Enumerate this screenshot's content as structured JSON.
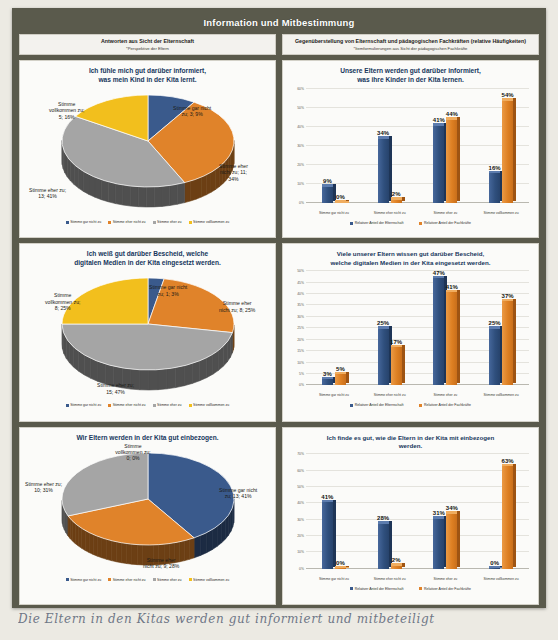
{
  "slide": {
    "title": "Information und Mitbestimmung",
    "frame_color": "#5a5a4c",
    "page_background": "#eceae3"
  },
  "columns": {
    "left": {
      "heading": "Antworten aus Sicht der Elternschaft",
      "subheading": "*Perspektive der Eltern"
    },
    "right": {
      "heading": "Gegenüberstellung von Elternschaft und pädagogischen Fachkräften (relative Häufigkeiten)",
      "subheading": "*Itemformulierungen aus Sicht der pädagogischen Fachkräfte"
    }
  },
  "palette": {
    "blue": "#3A5A8C",
    "orange": "#E0832A",
    "gray": "#A5A5A5",
    "yellow": "#F2BF1D",
    "title_text": "#16365C"
  },
  "pie_legend": [
    {
      "label": "Stimme gar nicht zu",
      "color": "#3A5A8C"
    },
    {
      "label": "Stimme eher nicht zu",
      "color": "#E0832A"
    },
    {
      "label": "Stimme eher zu",
      "color": "#A5A5A5"
    },
    {
      "label": "Stimme vollkommen zu",
      "color": "#F2BF1D"
    }
  ],
  "bar_legend": [
    {
      "label": "Relativer Anteil der Elternschaft",
      "color": "#3A5A8C"
    },
    {
      "label": "Relativer Anteil der Fachkräfte",
      "color": "#E0832A"
    }
  ],
  "bar_categories": [
    "Stimme gar nicht zu",
    "Stimme eher nicht zu",
    "Stimme eher zu",
    "Stimme vollkommen zu"
  ],
  "handwriting": "Die Eltern in den Kitas werden gut informiert und mitbeteiligt",
  "chart_data": [
    {
      "id": "pie1",
      "type": "pie",
      "title": "Ich fühle mich gut darüber informiert, was mein Kind in der Kita lernt.",
      "title_line1": "Ich fühle mich gut darüber informiert,",
      "title_line2": "was mein Kind in der Kita lernt.",
      "legend_position": "bottom",
      "categories": [
        "Stimme gar nicht zu",
        "Stimme eher nicht zu",
        "Stimme eher zu",
        "Stimme vollkommen zu"
      ],
      "counts": [
        3,
        11,
        13,
        5
      ],
      "percent": [
        9,
        34,
        41,
        16
      ],
      "colors": [
        "#3A5A8C",
        "#E0832A",
        "#A5A5A5",
        "#F2BF1D"
      ],
      "labels": [
        {
          "text_line1": "Stimme gar nicht",
          "text_line2": "zu; 3; 9%"
        },
        {
          "text_line1": "Stimme eher",
          "text_line2": "nicht zu; 11;",
          "text_line3": "34%"
        },
        {
          "text_line1": "Stimme eher zu;",
          "text_line2": "13; 41%"
        },
        {
          "text_line1": "Stimme",
          "text_line2": "vollkommen zu;",
          "text_line3": "5; 16%"
        }
      ]
    },
    {
      "id": "bar1",
      "type": "bar",
      "title_line1": "Unsere Eltern werden gut darüber informiert,",
      "title_line2": "was ihre Kinder in der Kita lernen.",
      "categories": [
        "Stimme gar nicht zu",
        "Stimme eher nicht zu",
        "Stimme eher zu",
        "Stimme vollkommen zu"
      ],
      "series": [
        {
          "name": "Relativer Anteil der Elternschaft",
          "color": "#3A5A8C",
          "values": [
            9,
            34,
            41,
            16
          ],
          "labels": [
            "9%",
            "34%",
            "41%",
            "16%"
          ]
        },
        {
          "name": "Relativer Anteil der Fachkräfte",
          "color": "#E0832A",
          "values": [
            0,
            2,
            44,
            54
          ],
          "labels": [
            "0%",
            "2%",
            "44%",
            "54%"
          ]
        }
      ],
      "ylim": [
        0,
        60
      ],
      "yticks": [
        0,
        10,
        20,
        30,
        40,
        50,
        60
      ],
      "yticklabels": [
        "0%",
        "10%",
        "20%",
        "30%",
        "40%",
        "50%",
        "60%"
      ],
      "xlabel": "",
      "ylabel": "",
      "grid": true,
      "legend_position": "bottom"
    },
    {
      "id": "pie2",
      "type": "pie",
      "title": "Ich weiß gut darüber Bescheid, welche digitalen Medien in der Kita eingesetzt werden.",
      "title_line1": "Ich weiß gut darüber Bescheid, welche",
      "title_line2": "digitalen Medien in der Kita eingesetzt werden.",
      "legend_position": "bottom",
      "categories": [
        "Stimme gar nicht zu",
        "Stimme eher nicht zu",
        "Stimme eher zu",
        "Stimme vollkommen zu"
      ],
      "counts": [
        1,
        8,
        15,
        8
      ],
      "percent": [
        3,
        25,
        47,
        25
      ],
      "colors": [
        "#3A5A8C",
        "#E0832A",
        "#A5A5A5",
        "#F2BF1D"
      ],
      "labels": [
        {
          "text_line1": "Stimme gar nicht",
          "text_line2": "zu; 1; 3%"
        },
        {
          "text_line1": "Stimme eher",
          "text_line2": "nicht zu; 8; 25%"
        },
        {
          "text_line1": "Stimme eher zu;",
          "text_line2": "15; 47%"
        },
        {
          "text_line1": "Stimme",
          "text_line2": "vollkommen zu;",
          "text_line3": "8; 25%"
        }
      ]
    },
    {
      "id": "bar2",
      "type": "bar",
      "title_line1": "Viele unserer Eltern wissen gut darüber Bescheid,",
      "title_line2": "welche digitalen Medien in der Kita eingesetzt werden.",
      "categories": [
        "Stimme gar nicht zu",
        "Stimme eher nicht zu",
        "Stimme eher zu",
        "Stimme vollkommen zu"
      ],
      "series": [
        {
          "name": "Relativer Anteil der Elternschaft",
          "color": "#3A5A8C",
          "values": [
            3,
            25,
            47,
            25
          ],
          "labels": [
            "3%",
            "25%",
            "47%",
            "25%"
          ]
        },
        {
          "name": "Relativer Anteil der Fachkräfte",
          "color": "#E0832A",
          "values": [
            5,
            17,
            41,
            37
          ],
          "labels": [
            "5%",
            "17%",
            "41%",
            "37%"
          ]
        }
      ],
      "ylim": [
        0,
        50
      ],
      "yticks": [
        0,
        5,
        10,
        15,
        20,
        25,
        30,
        35,
        40,
        45,
        50
      ],
      "yticklabels": [
        "0%",
        "5%",
        "10%",
        "15%",
        "20%",
        "25%",
        "30%",
        "35%",
        "40%",
        "45%",
        "50%"
      ],
      "xlabel": "",
      "ylabel": "",
      "grid": true,
      "legend_position": "bottom"
    },
    {
      "id": "pie3",
      "type": "pie",
      "title": "Wir Eltern werden in der Kita gut einbezogen.",
      "title_line1": "Wir Eltern werden in der Kita gut einbezogen.",
      "title_line2": "",
      "legend_position": "bottom",
      "categories": [
        "Stimme gar nicht zu",
        "Stimme eher nicht zu",
        "Stimme eher zu",
        "Stimme vollkommen zu"
      ],
      "counts": [
        13,
        9,
        10,
        0
      ],
      "percent": [
        41,
        28,
        31,
        0
      ],
      "colors": [
        "#3A5A8C",
        "#E0832A",
        "#A5A5A5",
        "#F2BF1D"
      ],
      "labels": [
        {
          "text_line1": "Stimme gar nicht",
          "text_line2": "zu; 13; 41%"
        },
        {
          "text_line1": "Stimme eher",
          "text_line2": "nicht zu; 9; 28%"
        },
        {
          "text_line1": "Stimme eher zu;",
          "text_line2": "10; 31%"
        },
        {
          "text_line1": "Stimme",
          "text_line2": "vollkommen zu;",
          "text_line3": "0; 0%"
        }
      ]
    },
    {
      "id": "bar3",
      "type": "bar",
      "title_line1": "Ich finde es gut, wie die Eltern in der Kita mit einbezogen",
      "title_line2": "werden.",
      "categories": [
        "Stimme gar nicht zu",
        "Stimme eher nicht zu",
        "Stimme eher zu",
        "Stimme vollkommen zu"
      ],
      "series": [
        {
          "name": "Relativer Anteil der Elternschaft",
          "color": "#3A5A8C",
          "values": [
            41,
            28,
            31,
            0
          ],
          "labels": [
            "41%",
            "28%",
            "31%",
            "0%"
          ]
        },
        {
          "name": "Relativer Anteil der Fachkräfte",
          "color": "#E0832A",
          "values": [
            0,
            2,
            34,
            63
          ],
          "labels": [
            "0%",
            "2%",
            "34%",
            "63%"
          ]
        }
      ],
      "ylim": [
        0,
        70
      ],
      "yticks": [
        0,
        10,
        20,
        30,
        40,
        50,
        60,
        70
      ],
      "yticklabels": [
        "0%",
        "10%",
        "20%",
        "30%",
        "40%",
        "50%",
        "60%",
        "70%"
      ],
      "xlabel": "",
      "ylabel": "",
      "grid": true,
      "legend_position": "bottom"
    }
  ]
}
